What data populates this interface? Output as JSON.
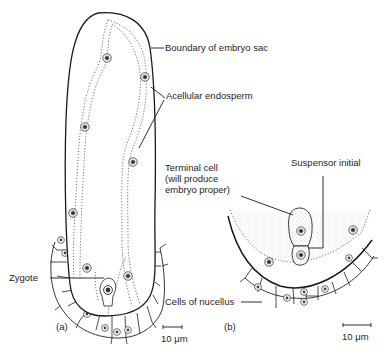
{
  "figure": {
    "panel_a": {
      "tag": "(a)",
      "labels": {
        "boundary": "Boundary of embryo sac",
        "endosperm": "Acellular endosperm",
        "zygote": "Zygote"
      },
      "scale_bar": "10 μm"
    },
    "panel_b": {
      "tag": "(b)",
      "labels": {
        "terminal_cell": "Terminal cell\n(will produce\nembryo proper)",
        "suspensor_initial": "Suspensor initial",
        "nucellus": "Cells of nucellus"
      },
      "scale_bar": "10 μm"
    },
    "colors": {
      "ink": "#1e1e1e",
      "dotted": "#555555",
      "stipple_fill": "#ececec",
      "background": "#ffffff"
    }
  }
}
